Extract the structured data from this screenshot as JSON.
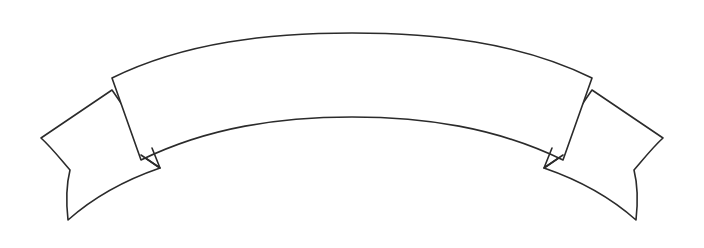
{
  "artwork": {
    "title": "Arched Swallowtail Banner Ribbon",
    "kind": "line-art-drawing",
    "caption_text": "",
    "canvas": {
      "width": 704,
      "height": 248,
      "background_color": "#ffffff"
    },
    "style": {
      "stroke_color": "#2b2b2b",
      "fill_color": "#ffffff",
      "stroke_width": 1.6,
      "line_style": "solid"
    },
    "geometry": {
      "symmetry_axis_x": 352,
      "band": {
        "top_arc_apex": [
          352,
          33
        ],
        "bottom_arc_apex": [
          352,
          117
        ],
        "left_fold_top": [
          112,
          78
        ],
        "left_fold_bottom": [
          141,
          160
        ],
        "right_fold_top": [
          592,
          78
        ],
        "right_fold_bottom": [
          563,
          160
        ],
        "thickness_at_center": 84
      },
      "left_tail": {
        "outer_tip": [
          41,
          138
        ],
        "notch_vertex": [
          70,
          170
        ],
        "lower_tip": [
          68,
          220
        ],
        "inner_notch": [
          160,
          168
        ]
      },
      "right_tail": {
        "outer_tip": [
          663,
          138
        ],
        "notch_vertex": [
          634,
          170
        ],
        "lower_tip": [
          636,
          220
        ],
        "inner_notch": [
          544,
          168
        ]
      }
    },
    "paths": {
      "band": "M 112 78 C 185 42, 270 33, 352 33 C 434 33, 519 42, 592 78 L 563 160 C 495 127, 424 117, 352 117 C 280 117, 209 127, 141 160 Z",
      "left_tail": "M 112 90 L 41 138 C 50 146, 58 156, 70 170 C 66 186, 66 202, 68 220 C 95 196, 128 179, 160 168 L 141 155 L 152 148 Z",
      "right_tail": "M 592 90 L 663 138 C 654 146, 646 156, 634 170 C 638 186, 638 202, 636 220 C 609 196, 576 179, 544 168 L 563 155 L 552 148 Z",
      "left_fold_notch": "M 141 155 L 160 168 L 152 148",
      "right_fold_notch": "M 563 155 L 544 168 L 552 148"
    }
  }
}
